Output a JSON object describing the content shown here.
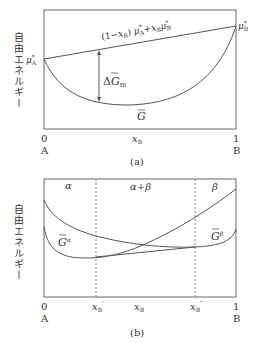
{
  "panel_a": {
    "ylabel": "自由エネルギー",
    "line_label_prefix": "(1−",
    "line_label": "(1−x_B) μ*_A + x_B μ*_B",
    "mu_a": "μ",
    "mu_a_sup": "*",
    "mu_a_sub": "A",
    "mu_b": "μ",
    "mu_b_sup": "*",
    "mu_b_sub": "B",
    "delta_label": "ΔG",
    "delta_sub": "m",
    "curve_label": "G",
    "x_start": "0",
    "x_end": "1",
    "x_var": "x",
    "x_var_sub": "B",
    "left_end": "A",
    "right_end": "B",
    "caption": "(a)"
  },
  "panel_b": {
    "ylabel": "自由エネルギー",
    "region_alpha": "α",
    "region_mix": "α+β",
    "region_beta": "β",
    "curve_alpha": "G",
    "curve_alpha_sup": "α",
    "curve_beta": "G",
    "curve_beta_sup": "β",
    "x_start": "0",
    "x_end": "1",
    "x_prime": "x",
    "x_prime_sub": "B",
    "x_prime_mark": "′",
    "x_var": "x",
    "x_var_sub": "B",
    "x_dprime": "x",
    "x_dprime_sub": "B",
    "x_dprime_mark": "″",
    "left_end": "A",
    "right_end": "B",
    "caption": "(b)"
  },
  "colors": {
    "line": "#555555",
    "text": "#333333",
    "background": "#ffffff"
  }
}
